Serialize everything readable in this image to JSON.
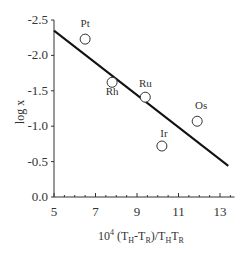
{
  "chart_data": {
    "type": "scatter",
    "title": "",
    "xlabel": "10^4 (T_H-T_R)/T_HT_R",
    "ylabel": "log x",
    "xlim": [
      5,
      13.7
    ],
    "ylim": [
      0.0,
      -2.5
    ],
    "y_inverted": true,
    "grid": false,
    "legend": "none",
    "x_ticks": [
      "5",
      "7",
      "9",
      "11",
      "13"
    ],
    "y_ticks": [
      "-2.5",
      "-2.0",
      "-1.5",
      "-1.0",
      "-0.5",
      "0.0"
    ],
    "points": [
      {
        "label": "Pt",
        "x": 6.5,
        "y": -2.23
      },
      {
        "label": "Rh",
        "x": 7.8,
        "y": -1.62
      },
      {
        "label": "Ru",
        "x": 9.4,
        "y": -1.41
      },
      {
        "label": "Ir",
        "x": 10.2,
        "y": -0.72
      },
      {
        "label": "Os",
        "x": 11.9,
        "y": -1.07
      }
    ],
    "fit_line": {
      "x": [
        5.0,
        13.4
      ],
      "y": [
        -2.35,
        -0.44
      ]
    }
  },
  "axis": {
    "x_title_base": "10",
    "x_title_sup": "4",
    "x_title_rest1": " (T",
    "sub_H": "H",
    "x_title_rest2": "-T",
    "sub_R": "R",
    "x_title_rest3": ")/T",
    "x_title_rest4": "T",
    "y_title": "log x"
  }
}
